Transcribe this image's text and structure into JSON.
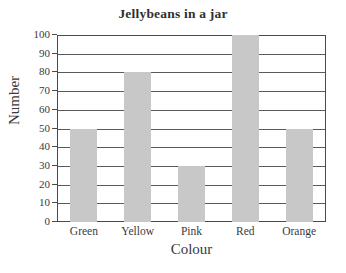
{
  "chart_data": {
    "type": "bar",
    "title": "Jellybeans in a jar",
    "xlabel": "Colour",
    "ylabel": "Number",
    "categories": [
      "Green",
      "Yellow",
      "Pink",
      "Red",
      "Orange"
    ],
    "values": [
      50,
      80,
      30,
      100,
      50
    ],
    "ylim": [
      0,
      100
    ],
    "ytick_step": 10,
    "yticks": [
      "100",
      "90",
      "80",
      "70",
      "60",
      "50",
      "40",
      "30",
      "20",
      "10",
      "0"
    ],
    "grid": true,
    "legend": false,
    "bar_color": "#c8c8c8",
    "axis_color": "#4a4a4a",
    "background": "#ffffff"
  }
}
